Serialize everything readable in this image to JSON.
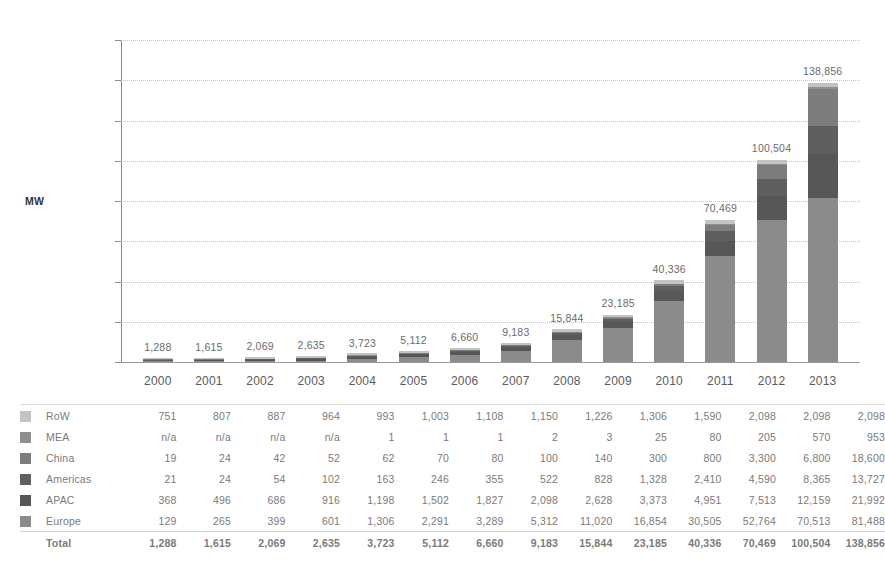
{
  "chart_data": {
    "type": "bar",
    "stacked": true,
    "title": "",
    "subtitle": "",
    "xlabel": "",
    "ylabel": "MW",
    "ylim": [
      0,
      160000
    ],
    "ytick_step": 20000,
    "ytick_labels": [
      "160,000",
      "140,000",
      "120,000",
      "100,000",
      "80,000",
      "60,000",
      "40,000",
      "20,000",
      "0"
    ],
    "ytick_values": [
      160000,
      140000,
      120000,
      100000,
      80000,
      60000,
      40000,
      20000,
      0
    ],
    "grid": true,
    "legend_position": "table-left",
    "categories": [
      "2000",
      "2001",
      "2002",
      "2003",
      "2004",
      "2005",
      "2006",
      "2007",
      "2008",
      "2009",
      "2010",
      "2011",
      "2012",
      "2013"
    ],
    "stack_order_bottom_to_top": [
      "Europe",
      "APAC",
      "Americas",
      "China",
      "MEA",
      "RoW"
    ],
    "series": [
      {
        "name": "RoW",
        "color": "#c3c3c3",
        "values": [
          751,
          807,
          887,
          964,
          993,
          1003,
          1108,
          1150,
          1226,
          1306,
          1590,
          2098,
          2098,
          2098
        ],
        "display": [
          "751",
          "807",
          "887",
          "964",
          "993",
          "1,003",
          "1,108",
          "1,150",
          "1,226",
          "1,306",
          "1,590",
          "2,098",
          "2,098",
          "2,098"
        ]
      },
      {
        "name": "MEA",
        "color": "#8f8f8f",
        "values": [
          0,
          0,
          0,
          0,
          1,
          1,
          1,
          2,
          3,
          25,
          80,
          205,
          570,
          953
        ],
        "display": [
          "n/a",
          "n/a",
          "n/a",
          "n/a",
          "1",
          "1",
          "1",
          "2",
          "3",
          "25",
          "80",
          "205",
          "570",
          "953"
        ]
      },
      {
        "name": "China",
        "color": "#7d7d7d",
        "values": [
          19,
          24,
          42,
          52,
          62,
          70,
          80,
          100,
          140,
          300,
          800,
          3300,
          6800,
          18600
        ],
        "display": [
          "19",
          "24",
          "42",
          "52",
          "62",
          "70",
          "80",
          "100",
          "140",
          "300",
          "800",
          "3,300",
          "6,800",
          "18,600"
        ]
      },
      {
        "name": "Americas",
        "color": "#5f5f5f",
        "values": [
          21,
          24,
          54,
          102,
          163,
          246,
          355,
          522,
          828,
          1328,
          2410,
          4590,
          8365,
          13727
        ],
        "display": [
          "21",
          "24",
          "54",
          "102",
          "163",
          "246",
          "355",
          "522",
          "828",
          "1,328",
          "2,410",
          "4,590",
          "8,365",
          "13,727"
        ]
      },
      {
        "name": "APAC",
        "color": "#575757",
        "values": [
          368,
          496,
          686,
          916,
          1198,
          1502,
          1827,
          2098,
          2628,
          3373,
          4951,
          7513,
          12159,
          21992
        ],
        "display": [
          "368",
          "496",
          "686",
          "916",
          "1,198",
          "1,502",
          "1,827",
          "2,098",
          "2,628",
          "3,373",
          "4,951",
          "7,513",
          "12,159",
          "21,992"
        ]
      },
      {
        "name": "Europe",
        "color": "#8b8b8b",
        "values": [
          129,
          265,
          399,
          601,
          1306,
          2291,
          3289,
          5312,
          11020,
          16854,
          30505,
          52764,
          70513,
          81488
        ],
        "display": [
          "129",
          "265",
          "399",
          "601",
          "1,306",
          "2,291",
          "3,289",
          "5,312",
          "11,020",
          "16,854",
          "30,505",
          "52,764",
          "70,513",
          "81,488"
        ]
      }
    ],
    "totals": [
      1288,
      1615,
      2069,
      2635,
      3723,
      5112,
      6660,
      9183,
      15844,
      23185,
      40336,
      70469,
      100504,
      138856
    ],
    "totals_display": [
      "1,288",
      "1,615",
      "2,069",
      "2,635",
      "3,723",
      "5,112",
      "6,660",
      "9,183",
      "15,844",
      "23,185",
      "40,336",
      "70,469",
      "100,504",
      "138,856"
    ],
    "bar_value_labels": [
      "1,288",
      "1,615",
      "2,069",
      "2,635",
      "3,723",
      "5,112",
      "6,660",
      "9,183",
      "15,844",
      "23,185",
      "40,336",
      "70,469",
      "100,504",
      "138,856"
    ]
  },
  "table": {
    "total_row_label": "Total"
  },
  "axis": {
    "unit_label": "MW"
  },
  "colors": {
    "row": "#c3c3c3",
    "mea": "#8f8f8f",
    "china": "#7d7d7d",
    "americas": "#5f5f5f",
    "apac": "#575757",
    "europe": "#8b8b8b",
    "gridline": "#c4c4c4",
    "axis": "#8a8a8a",
    "text": "#7a7a7a"
  }
}
